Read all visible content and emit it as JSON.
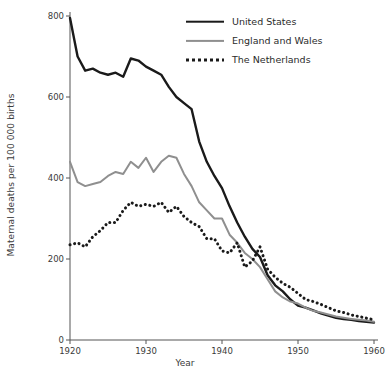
{
  "chart_data": {
    "type": "line",
    "title": "",
    "xlabel": "Year",
    "ylabel": "Maternal deaths per 100 000 births",
    "xlim": [
      1920,
      1960
    ],
    "ylim": [
      0,
      800
    ],
    "xticks": [
      1920,
      1930,
      1940,
      1950,
      1960
    ],
    "yticks": [
      0,
      200,
      400,
      600,
      800
    ],
    "grid": false,
    "legend_position": "top-right",
    "series": [
      {
        "name": "United States",
        "color": "#1a1a1a",
        "style": "solid",
        "x": [
          1920,
          1921,
          1922,
          1923,
          1924,
          1925,
          1926,
          1927,
          1928,
          1929,
          1930,
          1931,
          1932,
          1933,
          1934,
          1935,
          1936,
          1937,
          1938,
          1939,
          1940,
          1941,
          1942,
          1943,
          1944,
          1945,
          1946,
          1947,
          1948,
          1949,
          1950,
          1951,
          1952,
          1953,
          1954,
          1955,
          1956,
          1957,
          1958,
          1959,
          1960
        ],
        "values": [
          795,
          700,
          665,
          670,
          660,
          655,
          660,
          650,
          695,
          690,
          675,
          665,
          655,
          625,
          600,
          585,
          570,
          490,
          440,
          405,
          375,
          330,
          290,
          255,
          225,
          205,
          160,
          135,
          120,
          100,
          85,
          80,
          73,
          66,
          60,
          55,
          52,
          50,
          47,
          45,
          43
        ]
      },
      {
        "name": "England and Wales",
        "color": "#8f8f8f",
        "style": "solid",
        "x": [
          1920,
          1921,
          1922,
          1923,
          1924,
          1925,
          1926,
          1927,
          1928,
          1929,
          1930,
          1931,
          1932,
          1933,
          1934,
          1935,
          1936,
          1937,
          1938,
          1939,
          1940,
          1941,
          1942,
          1943,
          1944,
          1945,
          1946,
          1947,
          1948,
          1949,
          1950,
          1951,
          1952,
          1953,
          1954,
          1955,
          1956,
          1957,
          1958,
          1959,
          1960
        ],
        "values": [
          440,
          390,
          380,
          385,
          390,
          405,
          415,
          410,
          440,
          425,
          450,
          415,
          440,
          455,
          450,
          410,
          380,
          340,
          320,
          300,
          300,
          260,
          240,
          215,
          200,
          180,
          150,
          120,
          105,
          95,
          90,
          80,
          72,
          68,
          63,
          58,
          55,
          52,
          50,
          48,
          45
        ]
      },
      {
        "name": "The Netherlands",
        "color": "#1a1a1a",
        "style": "dotted",
        "x": [
          1920,
          1921,
          1922,
          1923,
          1924,
          1925,
          1926,
          1927,
          1928,
          1929,
          1930,
          1931,
          1932,
          1933,
          1934,
          1935,
          1936,
          1937,
          1938,
          1939,
          1940,
          1941,
          1942,
          1943,
          1944,
          1945,
          1946,
          1947,
          1948,
          1949,
          1950,
          1951,
          1952,
          1953,
          1954,
          1955,
          1956,
          1957,
          1958,
          1959,
          1960
        ],
        "values": [
          235,
          240,
          230,
          255,
          270,
          290,
          290,
          320,
          340,
          330,
          335,
          330,
          340,
          315,
          330,
          305,
          290,
          280,
          250,
          250,
          220,
          215,
          240,
          180,
          195,
          230,
          175,
          155,
          140,
          130,
          115,
          100,
          95,
          88,
          80,
          72,
          68,
          62,
          58,
          54,
          50
        ]
      }
    ],
    "legend": [
      {
        "label": "United States",
        "key": "united-states"
      },
      {
        "label": "England and Wales",
        "key": "england-and-wales"
      },
      {
        "label": "The Netherlands",
        "key": "the-netherlands"
      }
    ]
  }
}
